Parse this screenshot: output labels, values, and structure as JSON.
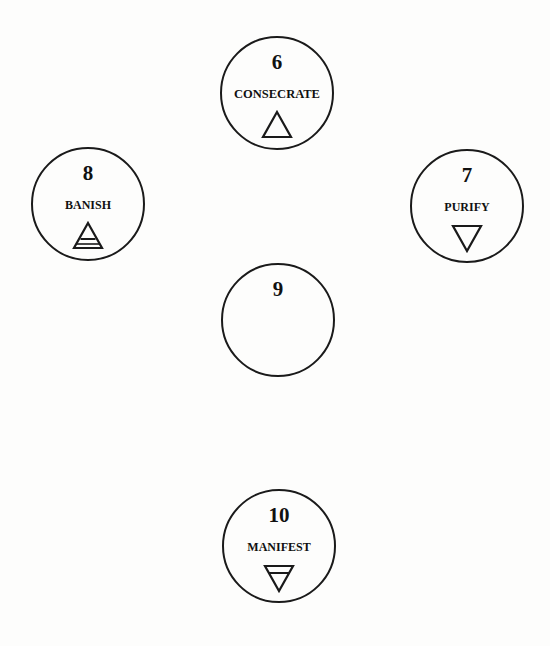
{
  "diagram": {
    "type": "sephirot-ritual-circles",
    "nodes": [
      {
        "id": "consecrate",
        "number": "6",
        "label": "CONSECRATE",
        "symbol": "fire-triangle-icon",
        "symbol_desc": "upward triangle"
      },
      {
        "id": "purify",
        "number": "7",
        "label": "PURIFY",
        "symbol": "water-triangle-icon",
        "symbol_desc": "downward triangle"
      },
      {
        "id": "banish",
        "number": "8",
        "label": "BANISH",
        "symbol": "air-triangle-icon",
        "symbol_desc": "upward triangle with horizontal bar"
      },
      {
        "id": "center",
        "number": "9",
        "label": "",
        "symbol": "",
        "symbol_desc": "empty"
      },
      {
        "id": "manifest",
        "number": "10",
        "label": "MANIFEST",
        "symbol": "earth-triangle-icon",
        "symbol_desc": "downward triangle with horizontal bar"
      }
    ]
  },
  "colors": {
    "background": "#fdfdfc",
    "stroke": "#1a1a1a",
    "text": "#111111"
  }
}
